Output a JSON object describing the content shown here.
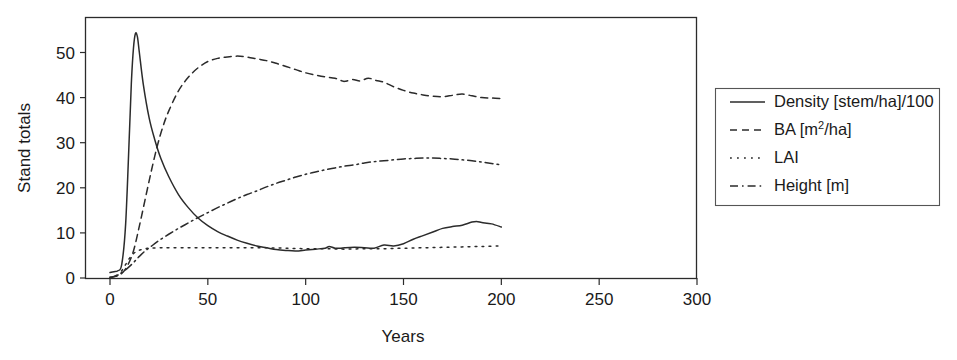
{
  "chart_data": {
    "type": "line",
    "title": "",
    "xlabel": "Years",
    "ylabel": "Stand totals",
    "xlim": [
      0,
      300
    ],
    "ylim": [
      0,
      57
    ],
    "xticks": [
      0,
      50,
      100,
      150,
      200,
      250,
      300
    ],
    "yticks": [
      0,
      10,
      20,
      30,
      40,
      50
    ],
    "grid": false,
    "legend_position": "right-outside",
    "series": [
      {
        "name": "Density [stem/ha]/100",
        "linestyle": "solid",
        "color": "#2b2b2b",
        "x": [
          0,
          2,
          4,
          6,
          8,
          10,
          11,
          12,
          13,
          14,
          15,
          17,
          20,
          23,
          26,
          30,
          35,
          40,
          45,
          50,
          55,
          60,
          65,
          70,
          75,
          80,
          85,
          90,
          95,
          100,
          105,
          110,
          112,
          115,
          118,
          120,
          125,
          130,
          135,
          140,
          145,
          150,
          155,
          160,
          165,
          170,
          175,
          180,
          185,
          188,
          190,
          195,
          200
        ],
        "y": [
          1.2,
          1.4,
          1.6,
          3.0,
          12.0,
          33.0,
          44.0,
          51.0,
          54.2,
          53.5,
          50.0,
          43.0,
          35.5,
          30.5,
          26.5,
          22.5,
          18.5,
          15.6,
          13.3,
          11.6,
          10.3,
          9.3,
          8.4,
          7.7,
          7.1,
          6.7,
          6.3,
          6.1,
          6.0,
          6.2,
          6.4,
          6.6,
          7.0,
          6.6,
          6.6,
          6.7,
          6.8,
          6.7,
          6.6,
          7.3,
          7.1,
          7.6,
          8.6,
          9.4,
          10.2,
          11.0,
          11.4,
          11.7,
          12.4,
          12.5,
          12.3,
          12.0,
          11.3
        ]
      },
      {
        "name": "BA [m2/ha]",
        "linestyle": "dashed",
        "color": "#2b2b2b",
        "x": [
          0,
          3,
          6,
          9,
          12,
          15,
          18,
          21,
          24,
          27,
          30,
          35,
          40,
          45,
          50,
          55,
          60,
          65,
          70,
          75,
          80,
          85,
          90,
          95,
          100,
          105,
          110,
          115,
          118,
          120,
          124,
          128,
          132,
          136,
          140,
          145,
          150,
          155,
          160,
          165,
          170,
          175,
          180,
          185,
          190,
          195,
          200
        ],
        "y": [
          0.2,
          0.4,
          1.0,
          2.8,
          6.0,
          11.5,
          17.5,
          23.5,
          29.0,
          33.5,
          37.0,
          41.5,
          44.5,
          46.6,
          48.0,
          48.7,
          49.0,
          49.2,
          49.0,
          48.6,
          48.2,
          47.6,
          46.9,
          46.2,
          45.5,
          45.0,
          44.6,
          44.3,
          43.8,
          43.6,
          44.0,
          43.7,
          44.3,
          43.8,
          43.4,
          42.4,
          41.6,
          41.0,
          40.6,
          40.3,
          40.2,
          40.5,
          40.8,
          40.4,
          40.0,
          39.9,
          39.8
        ]
      },
      {
        "name": "LAI",
        "linestyle": "dotted",
        "color": "#2b2b2b",
        "x": [
          0,
          2,
          4,
          6,
          8,
          10,
          12,
          14,
          16,
          18,
          20,
          25,
          30,
          40,
          50,
          60,
          70,
          80,
          90,
          100,
          110,
          120,
          130,
          140,
          150,
          160,
          170,
          180,
          190,
          200
        ],
        "y": [
          0.0,
          0.2,
          0.6,
          1.6,
          3.0,
          4.4,
          5.4,
          6.0,
          6.3,
          6.5,
          6.6,
          6.7,
          6.7,
          6.7,
          6.7,
          6.7,
          6.7,
          6.7,
          6.6,
          6.5,
          6.5,
          6.4,
          6.5,
          6.5,
          6.6,
          6.7,
          6.8,
          6.9,
          7.0,
          7.1
        ]
      },
      {
        "name": "Height [m]",
        "linestyle": "dashdot",
        "color": "#2b2b2b",
        "x": [
          0,
          3,
          6,
          9,
          12,
          15,
          18,
          21,
          25,
          30,
          35,
          40,
          45,
          50,
          55,
          60,
          65,
          70,
          75,
          80,
          85,
          90,
          95,
          100,
          105,
          110,
          115,
          120,
          125,
          130,
          135,
          140,
          145,
          150,
          155,
          160,
          165,
          170,
          175,
          180,
          185,
          190,
          195,
          200
        ],
        "y": [
          0.0,
          0.5,
          1.2,
          2.2,
          3.4,
          4.8,
          6.0,
          7.0,
          8.3,
          9.7,
          11.0,
          12.2,
          13.4,
          14.5,
          15.6,
          16.6,
          17.6,
          18.5,
          19.3,
          20.2,
          21.0,
          21.7,
          22.4,
          23.0,
          23.5,
          24.0,
          24.4,
          24.8,
          25.1,
          25.5,
          25.8,
          26.0,
          26.2,
          26.4,
          26.5,
          26.6,
          26.6,
          26.5,
          26.4,
          26.2,
          26.0,
          25.7,
          25.4,
          25.1
        ]
      }
    ]
  },
  "legend": {
    "entries": [
      {
        "label": "Density [stem/ha]/100",
        "style": "solid"
      },
      {
        "label_pre": "BA [m",
        "label_sup": "2",
        "label_post": "/ha]",
        "style": "dashed"
      },
      {
        "label": "LAI",
        "style": "dotted"
      },
      {
        "label": "Height [m]",
        "style": "dashdot"
      }
    ]
  }
}
